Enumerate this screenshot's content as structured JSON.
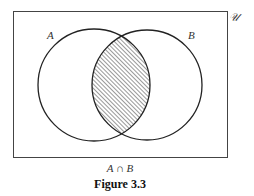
{
  "diagram": {
    "universe_label": "𝒰",
    "set_a_label": "A",
    "set_b_label": "B",
    "expression": "A ∩ B",
    "caption": "Figure 3.3",
    "shaded_region": "intersection",
    "colors": {
      "stroke": "#222222",
      "hatch": "#333333",
      "background": "#ffffff"
    }
  }
}
